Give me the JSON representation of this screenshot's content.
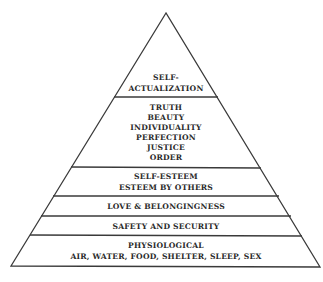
{
  "diagram": {
    "shape": "pyramid",
    "colors": {
      "background": "#ffffff",
      "stroke": "#3a3a3a",
      "text": "#2a2a2a"
    },
    "tiers": [
      {
        "id": "self-actualization",
        "lines": [
          "SELF-",
          "ACTUALIZATION"
        ]
      },
      {
        "id": "being-values",
        "lines": [
          "TRUTH",
          "BEAUTY",
          "INDIVIDUALITY",
          "PERFECTION",
          "JUSTICE",
          "ORDER"
        ]
      },
      {
        "id": "esteem",
        "lines": [
          "SELF-ESTEEM",
          "ESTEEM BY OTHERS"
        ]
      },
      {
        "id": "love",
        "lines": [
          "LOVE & BELONGINGNESS"
        ]
      },
      {
        "id": "safety",
        "lines": [
          "SAFETY AND SECURITY"
        ]
      },
      {
        "id": "physiological",
        "lines": [
          "PHYSIOLOGICAL",
          "AIR, WATER, FOOD, SHELTER, SLEEP, SEX"
        ]
      }
    ]
  }
}
